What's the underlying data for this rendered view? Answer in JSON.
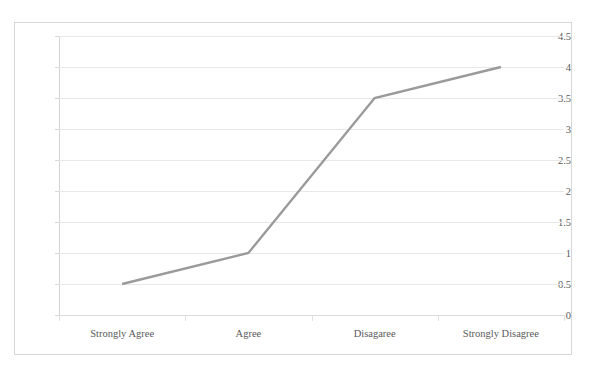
{
  "chart_data": {
    "type": "line",
    "title": "",
    "xlabel": "",
    "ylabel": "",
    "categories": [
      "Strongly Agree",
      "Agree",
      "Disagaree",
      "Strongly Disagree"
    ],
    "values": [
      0.5,
      1,
      3.5,
      4
    ],
    "series": [
      {
        "name": "",
        "values": [
          0.5,
          1,
          3.5,
          4
        ]
      }
    ],
    "ylim": [
      0,
      4.5
    ],
    "ytick_step": 0.5,
    "yticks": [
      "0",
      "0.5",
      "1",
      "1.5",
      "2",
      "2.5",
      "3",
      "3.5",
      "4",
      "4.5"
    ],
    "grid": true,
    "legend": "none",
    "markers": "none",
    "line_color": "#9a9a9a",
    "grid_color": "#e8e8e8",
    "axis_color": "#d3d3d3",
    "frame_color": "#d7d7d7",
    "background": "#ffffff",
    "text_color": "#5a5a5a"
  }
}
